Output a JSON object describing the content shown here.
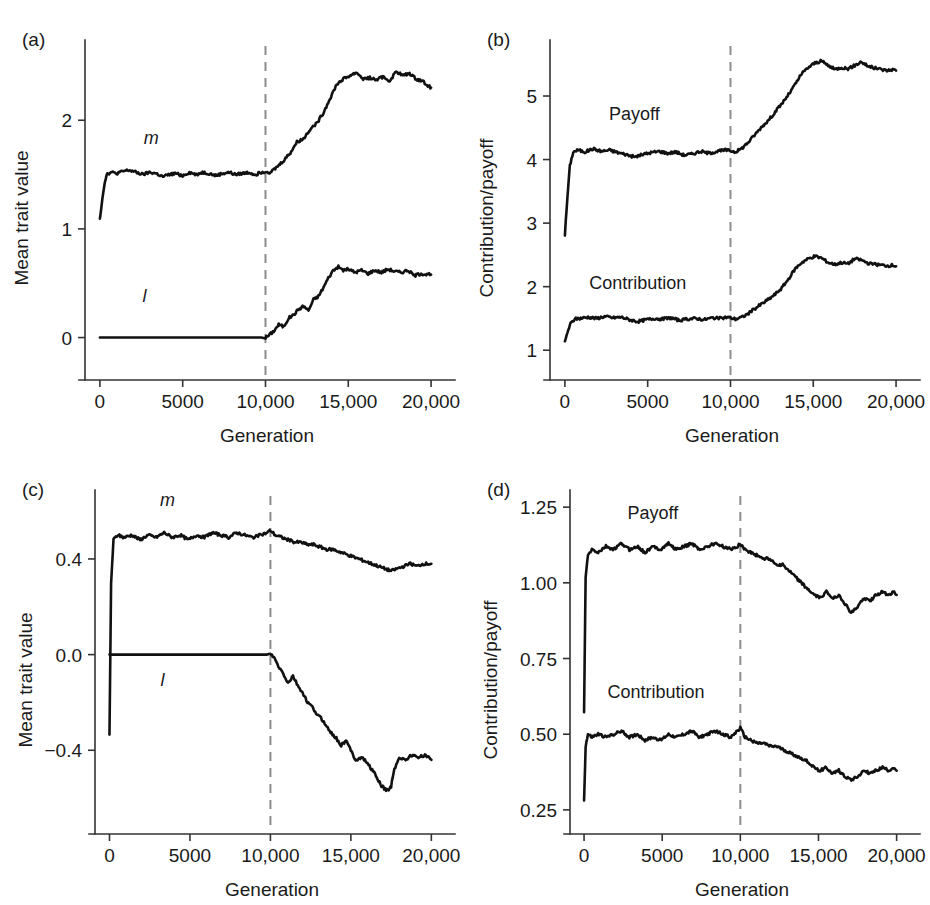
{
  "figure": {
    "background": "#ffffff",
    "curve_color": "#111111",
    "axis_color": "#333333",
    "event_line_color": "#8d8d8d"
  },
  "chart_data": [
    {
      "id": "a",
      "type": "line",
      "panel_letter": "(a)",
      "title": "",
      "xlabel": "Generation",
      "ylabel": "Mean trait value",
      "xlim": [
        -900,
        20600
      ],
      "ylim": [
        -0.28,
        2.72
      ],
      "grid": false,
      "legend": "inline-labels",
      "xticks": [
        0,
        5000,
        10000,
        15000,
        20000
      ],
      "xticklabels": [
        "0",
        "5000",
        "10,000",
        "15,000",
        "20,000"
      ],
      "yticks": [
        0,
        1,
        2
      ],
      "yticklabels": [
        "0",
        "1",
        "2"
      ],
      "annotations": [
        {
          "text": "m",
          "x": 3100,
          "y": 1.78,
          "italic": true
        },
        {
          "text": "l",
          "x": 2700,
          "y": 0.33,
          "italic": true
        }
      ],
      "event_marker": {
        "x": 10000,
        "style": "dashed-vertical",
        "label": ""
      },
      "series": [
        {
          "name": "m",
          "x": [
            0,
            150,
            300,
            450,
            700,
            1000,
            1400,
            1800,
            2200,
            2600,
            3000,
            3400,
            3800,
            4200,
            4600,
            5000,
            5400,
            5800,
            6200,
            6600,
            7000,
            7400,
            7800,
            8200,
            8600,
            9000,
            9400,
            9700,
            10000,
            10300,
            10700,
            11100,
            11500,
            11900,
            12300,
            12700,
            13100,
            13500,
            13900,
            14300,
            14700,
            15100,
            15500,
            15900,
            16300,
            16700,
            17100,
            17500,
            17900,
            18300,
            18700,
            19100,
            19500,
            19800,
            20000
          ],
          "values": [
            1.1,
            1.28,
            1.44,
            1.51,
            1.52,
            1.51,
            1.53,
            1.54,
            1.52,
            1.5,
            1.52,
            1.51,
            1.48,
            1.5,
            1.51,
            1.49,
            1.52,
            1.5,
            1.52,
            1.51,
            1.49,
            1.51,
            1.52,
            1.5,
            1.51,
            1.52,
            1.5,
            1.52,
            1.53,
            1.52,
            1.57,
            1.63,
            1.7,
            1.8,
            1.83,
            1.92,
            1.97,
            2.07,
            2.2,
            2.33,
            2.38,
            2.41,
            2.44,
            2.38,
            2.39,
            2.37,
            2.4,
            2.36,
            2.45,
            2.41,
            2.43,
            2.38,
            2.36,
            2.32,
            2.3
          ]
        },
        {
          "name": "l",
          "x": [
            0,
            2000,
            4000,
            6000,
            8000,
            9500,
            10000,
            10200,
            10500,
            10800,
            11100,
            11400,
            11700,
            12000,
            12300,
            12600,
            12900,
            13200,
            13500,
            13800,
            14100,
            14400,
            14700,
            15000,
            15400,
            15800,
            16200,
            16600,
            17000,
            17400,
            17800,
            18200,
            18600,
            19000,
            19400,
            19700,
            20000
          ],
          "values": [
            0.0,
            0.0,
            0.0,
            0.0,
            0.0,
            0.0,
            0.0,
            0.02,
            0.06,
            0.12,
            0.1,
            0.18,
            0.21,
            0.26,
            0.29,
            0.25,
            0.35,
            0.38,
            0.46,
            0.55,
            0.62,
            0.65,
            0.62,
            0.63,
            0.6,
            0.62,
            0.59,
            0.62,
            0.6,
            0.63,
            0.61,
            0.6,
            0.62,
            0.57,
            0.59,
            0.58,
            0.58
          ]
        }
      ]
    },
    {
      "id": "b",
      "type": "line",
      "panel_letter": "(b)",
      "title": "",
      "xlabel": "Generation",
      "ylabel": "Contribution/payoff",
      "xlim": [
        -900,
        20600
      ],
      "ylim": [
        0.72,
        5.85
      ],
      "grid": false,
      "legend": "inline-labels",
      "xticks": [
        0,
        5000,
        10000,
        15000,
        20000
      ],
      "xticklabels": [
        "0",
        "5000",
        "10,000",
        "15,000",
        "20,000"
      ],
      "yticks": [
        1,
        2,
        3,
        4,
        5
      ],
      "yticklabels": [
        "1",
        "2",
        "3",
        "4",
        "5"
      ],
      "annotations": [
        {
          "text": "Payoff",
          "x": 4200,
          "y": 4.62,
          "italic": false
        },
        {
          "text": "Contribution",
          "x": 4400,
          "y": 1.97,
          "italic": false
        }
      ],
      "event_marker": {
        "x": 10000,
        "style": "dashed-vertical",
        "label": ""
      },
      "series": [
        {
          "name": "Payoff",
          "x": [
            0,
            150,
            300,
            500,
            800,
            1200,
            1700,
            2200,
            2700,
            3200,
            3700,
            4200,
            4700,
            5200,
            5700,
            6200,
            6700,
            7200,
            7700,
            8200,
            8700,
            9200,
            9700,
            10000,
            10300,
            10700,
            11100,
            11500,
            11900,
            12300,
            12700,
            13100,
            13500,
            13900,
            14300,
            14700,
            15100,
            15500,
            15900,
            16300,
            16700,
            17100,
            17500,
            17900,
            18300,
            18700,
            19100,
            19500,
            19800,
            20000
          ],
          "values": [
            2.82,
            3.4,
            3.9,
            4.12,
            4.15,
            4.12,
            4.17,
            4.13,
            4.15,
            4.11,
            4.08,
            4.04,
            4.08,
            4.11,
            4.13,
            4.1,
            4.12,
            4.07,
            4.09,
            4.13,
            4.1,
            4.13,
            4.15,
            4.14,
            4.12,
            4.18,
            4.28,
            4.4,
            4.52,
            4.62,
            4.75,
            4.88,
            5.02,
            5.18,
            5.35,
            5.45,
            5.52,
            5.55,
            5.48,
            5.42,
            5.45,
            5.43,
            5.48,
            5.54,
            5.47,
            5.44,
            5.42,
            5.4,
            5.42,
            5.4
          ]
        },
        {
          "name": "Contribution",
          "x": [
            0,
            150,
            350,
            600,
            900,
            1400,
            1900,
            2400,
            2900,
            3400,
            3900,
            4400,
            4900,
            5400,
            5900,
            6400,
            6900,
            7400,
            7900,
            8400,
            8900,
            9400,
            9800,
            10000,
            10300,
            10700,
            11100,
            11500,
            11900,
            12300,
            12700,
            13100,
            13500,
            13900,
            14300,
            14700,
            15100,
            15500,
            15900,
            16300,
            16700,
            17100,
            17500,
            17900,
            18300,
            18700,
            19100,
            19500,
            19800,
            20000
          ],
          "values": [
            1.12,
            1.28,
            1.42,
            1.49,
            1.5,
            1.52,
            1.5,
            1.53,
            1.51,
            1.52,
            1.48,
            1.45,
            1.48,
            1.5,
            1.49,
            1.51,
            1.47,
            1.49,
            1.5,
            1.48,
            1.51,
            1.5,
            1.52,
            1.51,
            1.49,
            1.52,
            1.58,
            1.66,
            1.73,
            1.8,
            1.88,
            1.98,
            2.12,
            2.28,
            2.38,
            2.44,
            2.48,
            2.45,
            2.38,
            2.35,
            2.38,
            2.36,
            2.44,
            2.42,
            2.37,
            2.35,
            2.34,
            2.33,
            2.34,
            2.32
          ]
        }
      ]
    },
    {
      "id": "c",
      "type": "line",
      "panel_letter": "(c)",
      "title": "",
      "xlabel": "Generation",
      "ylabel": "Mean trait value",
      "xlim": [
        -900,
        20600
      ],
      "ylim": [
        -0.7,
        0.68
      ],
      "grid": false,
      "legend": "inline-labels",
      "xticks": [
        0,
        5000,
        10000,
        15000,
        20000
      ],
      "xticklabels": [
        "0",
        "5000",
        "10,000",
        "15,000",
        "20,000"
      ],
      "yticks": [
        -0.4,
        0.0,
        0.4
      ],
      "yticklabels": [
        "−0.4",
        "0.0",
        "0.4"
      ],
      "annotations": [
        {
          "text": "m",
          "x": 3600,
          "y": 0.62,
          "italic": true
        },
        {
          "text": "l",
          "x": 3300,
          "y": -0.13,
          "italic": true
        }
      ],
      "event_marker": {
        "x": 10000,
        "style": "dashed-vertical",
        "label": ""
      },
      "series": [
        {
          "name": "m",
          "x": [
            0,
            100,
            250,
            500,
            900,
            1400,
            1900,
            2400,
            2900,
            3400,
            3900,
            4400,
            4900,
            5400,
            5900,
            6400,
            6900,
            7400,
            7900,
            8400,
            8900,
            9400,
            9800,
            10000,
            10300,
            10700,
            11100,
            11500,
            11900,
            12300,
            12700,
            13100,
            13500,
            13900,
            14300,
            14700,
            15100,
            15500,
            15900,
            16300,
            16700,
            17100,
            17500,
            17900,
            18300,
            18700,
            19100,
            19500,
            19800,
            20000
          ],
          "values": [
            -0.34,
            0.3,
            0.48,
            0.5,
            0.49,
            0.5,
            0.48,
            0.5,
            0.49,
            0.51,
            0.49,
            0.5,
            0.48,
            0.5,
            0.49,
            0.51,
            0.5,
            0.49,
            0.51,
            0.5,
            0.49,
            0.5,
            0.51,
            0.52,
            0.5,
            0.49,
            0.48,
            0.47,
            0.47,
            0.46,
            0.46,
            0.45,
            0.44,
            0.44,
            0.43,
            0.42,
            0.41,
            0.4,
            0.39,
            0.38,
            0.37,
            0.36,
            0.35,
            0.36,
            0.37,
            0.38,
            0.37,
            0.38,
            0.38,
            0.38
          ]
        },
        {
          "name": "l",
          "x": [
            0,
            2000,
            4000,
            6000,
            8000,
            9500,
            10000,
            10200,
            10500,
            10800,
            11100,
            11400,
            11700,
            12000,
            12300,
            12600,
            12900,
            13200,
            13500,
            13800,
            14100,
            14400,
            14700,
            15000,
            15300,
            15700,
            16100,
            16500,
            16900,
            17300,
            17500,
            17700,
            18000,
            18400,
            18800,
            19200,
            19600,
            20000
          ],
          "values": [
            0.0,
            0.0,
            0.0,
            0.0,
            0.0,
            0.0,
            0.0,
            -0.01,
            -0.05,
            -0.08,
            -0.12,
            -0.09,
            -0.13,
            -0.16,
            -0.2,
            -0.22,
            -0.25,
            -0.27,
            -0.3,
            -0.33,
            -0.35,
            -0.38,
            -0.36,
            -0.4,
            -0.44,
            -0.43,
            -0.46,
            -0.5,
            -0.55,
            -0.57,
            -0.55,
            -0.48,
            -0.43,
            -0.44,
            -0.42,
            -0.43,
            -0.42,
            -0.44
          ]
        }
      ]
    },
    {
      "id": "d",
      "type": "line",
      "panel_letter": "(d)",
      "title": "",
      "xlabel": "Generation",
      "ylabel": "Contribution/payoff",
      "xlim": [
        -900,
        20600
      ],
      "ylim": [
        0.21,
        1.3
      ],
      "grid": false,
      "legend": "inline-labels",
      "xticks": [
        0,
        5000,
        10000,
        15000,
        20000
      ],
      "xticklabels": [
        "0",
        "5000",
        "10,000",
        "15,000",
        "20,000"
      ],
      "yticks": [
        0.25,
        0.5,
        0.75,
        1.0,
        1.25
      ],
      "yticklabels": [
        "0.25",
        "0.50",
        "0.75",
        "1.00",
        "1.25"
      ],
      "annotations": [
        {
          "text": "Payoff",
          "x": 4400,
          "y": 1.21,
          "italic": false
        },
        {
          "text": "Contribution",
          "x": 4600,
          "y": 0.62,
          "italic": false
        }
      ],
      "event_marker": {
        "x": 10000,
        "style": "dashed-vertical",
        "label": ""
      },
      "series": [
        {
          "name": "Payoff",
          "x": [
            0,
            100,
            250,
            500,
            900,
            1400,
            1900,
            2400,
            2900,
            3400,
            3900,
            4400,
            4900,
            5400,
            5900,
            6400,
            6900,
            7400,
            7900,
            8400,
            8900,
            9400,
            9800,
            10000,
            10300,
            10700,
            11100,
            11500,
            11900,
            12300,
            12700,
            13100,
            13500,
            13900,
            14300,
            14700,
            15100,
            15500,
            15900,
            16300,
            16700,
            17100,
            17500,
            17900,
            18300,
            18700,
            19100,
            19500,
            19800,
            20000
          ],
          "values": [
            0.57,
            1.02,
            1.09,
            1.11,
            1.1,
            1.12,
            1.11,
            1.13,
            1.11,
            1.12,
            1.1,
            1.12,
            1.11,
            1.13,
            1.11,
            1.12,
            1.13,
            1.11,
            1.12,
            1.13,
            1.12,
            1.11,
            1.12,
            1.13,
            1.11,
            1.1,
            1.09,
            1.08,
            1.08,
            1.06,
            1.06,
            1.04,
            1.02,
            1.0,
            0.98,
            0.96,
            0.95,
            0.97,
            0.95,
            0.96,
            0.93,
            0.9,
            0.92,
            0.95,
            0.94,
            0.96,
            0.97,
            0.96,
            0.97,
            0.96
          ]
        },
        {
          "name": "Contribution",
          "x": [
            0,
            100,
            250,
            500,
            900,
            1400,
            1900,
            2400,
            2900,
            3400,
            3900,
            4400,
            4900,
            5400,
            5900,
            6400,
            6900,
            7400,
            7900,
            8400,
            8900,
            9400,
            9800,
            10000,
            10300,
            10700,
            11100,
            11500,
            11900,
            12300,
            12700,
            13100,
            13500,
            13900,
            14300,
            14700,
            15100,
            15500,
            15900,
            16300,
            16700,
            17100,
            17500,
            17900,
            18300,
            18700,
            19100,
            19500,
            19800,
            20000
          ],
          "values": [
            0.28,
            0.46,
            0.5,
            0.49,
            0.5,
            0.49,
            0.5,
            0.51,
            0.49,
            0.5,
            0.48,
            0.49,
            0.48,
            0.5,
            0.49,
            0.5,
            0.51,
            0.49,
            0.5,
            0.51,
            0.5,
            0.49,
            0.51,
            0.52,
            0.49,
            0.48,
            0.47,
            0.47,
            0.46,
            0.46,
            0.45,
            0.44,
            0.43,
            0.42,
            0.41,
            0.39,
            0.38,
            0.39,
            0.37,
            0.38,
            0.36,
            0.35,
            0.36,
            0.38,
            0.37,
            0.38,
            0.39,
            0.38,
            0.39,
            0.38
          ]
        }
      ]
    }
  ]
}
